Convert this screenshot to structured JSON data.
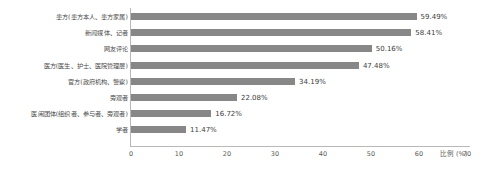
{
  "chart_data": {
    "type": "bar",
    "orientation": "horizontal",
    "title": "",
    "xlabel": "比例 (%)",
    "ylabel": "",
    "xlim": [
      0,
      70
    ],
    "xticks": [
      0,
      10,
      20,
      30,
      40,
      50,
      60,
      70
    ],
    "xtick_labels": [
      "0",
      "10",
      "20",
      "30",
      "40",
      "50",
      "60",
      "70"
    ],
    "grid": false,
    "legend": false,
    "bar_color": "#878787",
    "axis_color": "#b8b8b8",
    "categories": [
      "患方(患方本人、患方家属)",
      "新闻媒体、记者",
      "网友评论",
      "医方(医生、护士、医院管理层)",
      "官方(政府机构、警察)",
      "旁观者",
      "医闹团体(组织者、参与者、旁观者)",
      "学者"
    ],
    "values": [
      59.49,
      58.41,
      50.16,
      47.48,
      34.19,
      22.08,
      16.72,
      11.47
    ],
    "value_labels": [
      "59.49%",
      "58.41%",
      "50.16%",
      "47.48%",
      "34.19%",
      "22.08%",
      "16.72%",
      "11.47%"
    ]
  }
}
